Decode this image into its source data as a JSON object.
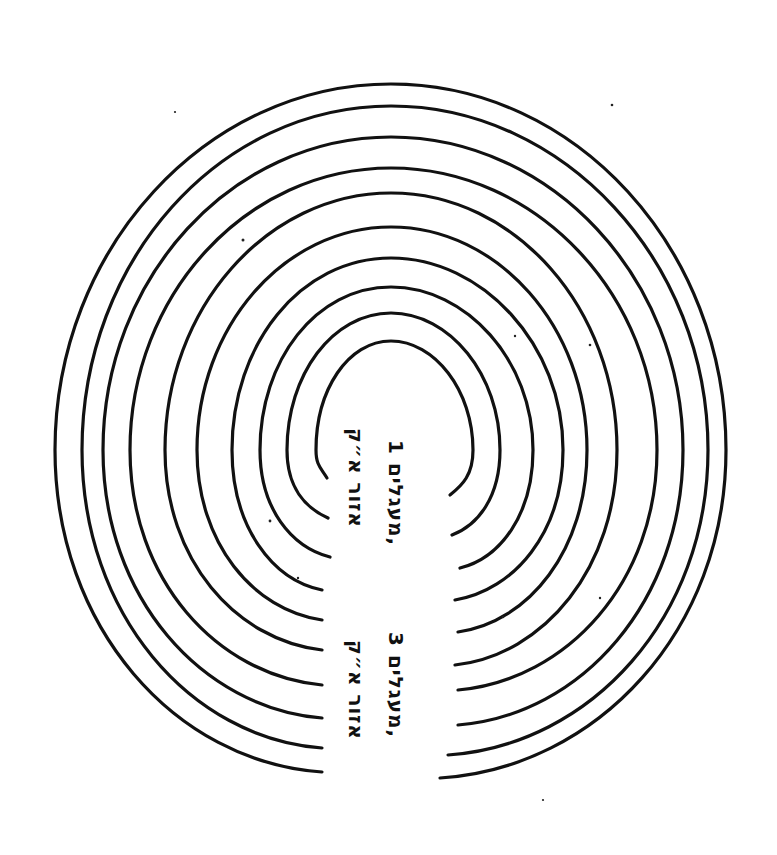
{
  "figure": {
    "type": "concentric-arcs-maze",
    "ring_count": 10,
    "stroke_color": "#111111",
    "background": "#ffffff",
    "rings": [
      {
        "id": 1,
        "left_end": [
          322,
          772
        ],
        "right_end": [
          440,
          778
        ],
        "top_y": 84,
        "left_x": 55,
        "right_x": 726
      },
      {
        "id": 2,
        "left_end": [
          322,
          748
        ],
        "right_end": [
          448,
          755
        ],
        "top_y": 106,
        "left_x": 82,
        "right_x": 708
      },
      {
        "id": 3,
        "left_end": [
          322,
          718
        ],
        "right_end": [
          458,
          725
        ],
        "top_y": 137,
        "left_x": 103,
        "right_x": 683
      },
      {
        "id": 4,
        "left_end": [
          322,
          685
        ],
        "right_end": [
          458,
          690
        ],
        "top_y": 168,
        "left_x": 130,
        "right_x": 657
      },
      {
        "id": 5,
        "left_end": [
          322,
          650
        ],
        "right_end": [
          455,
          665
        ],
        "top_y": 193,
        "left_x": 165,
        "right_x": 617
      },
      {
        "id": 6,
        "left_end": [
          322,
          620
        ],
        "right_end": [
          458,
          632
        ],
        "top_y": 227,
        "left_x": 197,
        "right_x": 587
      },
      {
        "id": 7,
        "left_end": [
          322,
          590
        ],
        "right_end": [
          455,
          600
        ],
        "top_y": 258,
        "left_x": 232,
        "right_x": 563
      },
      {
        "id": 8,
        "left_end": [
          330,
          557
        ],
        "right_end": [
          460,
          568
        ],
        "top_y": 287,
        "left_x": 260,
        "right_x": 533
      },
      {
        "id": 9,
        "left_end": [
          328,
          518
        ],
        "right_end": [
          452,
          535
        ],
        "top_y": 313,
        "left_x": 287,
        "right_x": 500
      },
      {
        "id": 10,
        "left_end": [
          327,
          478
        ],
        "right_end": [
          450,
          495
        ],
        "top_y": 341,
        "left_x": 316,
        "right_x": 473
      }
    ]
  },
  "labels": {
    "upper_right": "מעגלים 1,",
    "upper_left": "אזור א״ק",
    "lower_right": "מעגלים 3,",
    "lower_left": "אזור א״ק"
  }
}
